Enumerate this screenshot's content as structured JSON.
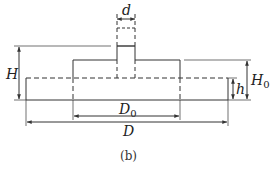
{
  "figure": {
    "caption": "(b)",
    "labels": {
      "d": "d",
      "H": "H",
      "H0_main": "H",
      "H0_sub": "0",
      "h": "h",
      "D0_main": "D",
      "D0_sub": "0",
      "D": "D"
    },
    "stroke_color": "#333333",
    "shapes": [
      {
        "name": "base-plate",
        "style": "solid bottom/sides, dashed top"
      },
      {
        "name": "middle-boss",
        "dimension": "D0"
      },
      {
        "name": "stem",
        "dimension": "d",
        "style": "solid lower part, dashed upper part"
      }
    ],
    "dimensions": [
      "d",
      "H",
      "H0",
      "h",
      "D0",
      "D"
    ]
  }
}
